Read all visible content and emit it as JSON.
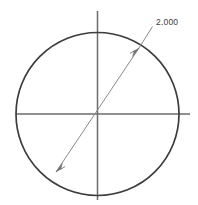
{
  "drawing": {
    "title": "circle-diameter-dimension",
    "background_color": "#ffffff",
    "geometry_color": "#3c3c3c",
    "centerline_color": "#6b6b6b",
    "dimension_color": "#7a7a7a",
    "text_color": "#3a3a3a",
    "circle": {
      "name": "circle-outline",
      "center_x": 97.5,
      "center_y": 114,
      "radius": 81.5,
      "stroke_width": 1.6
    },
    "centerlines": {
      "horizontal": {
        "name": "horizontal-centerline",
        "x1": 16,
        "y1": 114,
        "x2": 190,
        "y2": 114
      },
      "vertical": {
        "name": "vertical-centerline",
        "x1": 97.5,
        "y1": 11,
        "x2": 97.5,
        "y2": 200
      }
    },
    "dimension": {
      "name": "diameter-dimension",
      "label": "2.000",
      "label_x": 156,
      "label_y": 25,
      "leader": {
        "x1": 152,
        "y1": 27,
        "x2": 140,
        "y2": 47
      },
      "dimension_line": {
        "x1": 56,
        "y1": 172,
        "x2": 139,
        "y2": 48
      },
      "arrow_start": {
        "name": "arrowhead-lower-left",
        "x": 56,
        "y": 172
      },
      "arrow_end": {
        "name": "arrowhead-upper-right",
        "x": 139,
        "y": 48
      }
    }
  }
}
